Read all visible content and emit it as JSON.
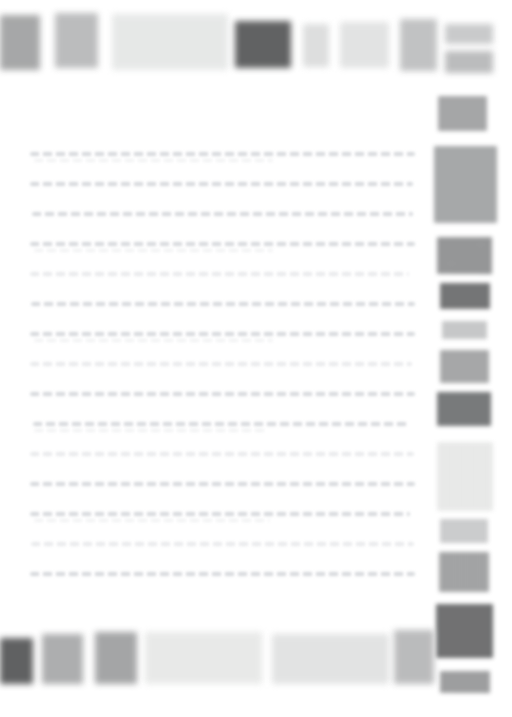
{
  "page": {
    "width": 512,
    "height": 717,
    "background": "#ffffff"
  },
  "toolbar_top": {
    "name": "top-toolbar",
    "items": [
      {
        "label": "",
        "color": "#a9aaab",
        "x": 0,
        "y": 15,
        "w": 40,
        "h": 55,
        "texture": "noise"
      },
      {
        "label": "",
        "color": "#c0c1c2",
        "x": 55,
        "y": 13,
        "w": 43,
        "h": 55,
        "texture": "noise"
      },
      {
        "label": "",
        "color": "#eef0ef",
        "x": 112,
        "y": 14,
        "w": 116,
        "h": 56,
        "texture": "noise"
      },
      {
        "label": "",
        "color": "#5e5f60",
        "x": 235,
        "y": 21,
        "w": 56,
        "h": 47,
        "texture": "noise"
      },
      {
        "label": "",
        "color": "#dcdddd",
        "x": 303,
        "y": 24,
        "w": 26,
        "h": 43,
        "texture": "plain"
      },
      {
        "label": "",
        "color": "#e9eaea",
        "x": 340,
        "y": 22,
        "w": 49,
        "h": 46,
        "texture": "noise"
      },
      {
        "label": "",
        "color": "#c6c7c8",
        "x": 400,
        "y": 19,
        "w": 37,
        "h": 52,
        "texture": "noise"
      },
      {
        "label": "",
        "color": "#c7c8c9",
        "x": 445,
        "y": 24,
        "w": 48,
        "h": 20,
        "texture": "plain"
      },
      {
        "label": "",
        "color": "#b9babb",
        "x": 445,
        "y": 51,
        "w": 48,
        "h": 22,
        "texture": "plain"
      }
    ]
  },
  "document_body": {
    "name": "document-text-area",
    "x": 30,
    "y": 152,
    "width": 385,
    "line_count": 15,
    "line_spacing": 30,
    "lines": [
      {
        "indent": 0,
        "length": 385,
        "weight": "normal"
      },
      {
        "indent": 0,
        "length": 383,
        "weight": "normal"
      },
      {
        "indent": 2,
        "length": 381,
        "weight": "normal"
      },
      {
        "indent": 0,
        "length": 385,
        "weight": "normal"
      },
      {
        "indent": 0,
        "length": 379,
        "weight": "faint"
      },
      {
        "indent": 1,
        "length": 384,
        "weight": "normal"
      },
      {
        "indent": 0,
        "length": 385,
        "weight": "normal"
      },
      {
        "indent": 0,
        "length": 382,
        "weight": "faint"
      },
      {
        "indent": 0,
        "length": 385,
        "weight": "normal"
      },
      {
        "indent": 3,
        "length": 377,
        "weight": "normal"
      },
      {
        "indent": 0,
        "length": 384,
        "weight": "faint"
      },
      {
        "indent": 0,
        "length": 385,
        "weight": "normal"
      },
      {
        "indent": 0,
        "length": 380,
        "weight": "normal"
      },
      {
        "indent": 1,
        "length": 383,
        "weight": "faint"
      },
      {
        "indent": 0,
        "length": 385,
        "weight": "normal"
      }
    ]
  },
  "sidebar_right": {
    "name": "right-sidebar",
    "items": [
      {
        "label": "",
        "color": "#a8a9aa",
        "x": 438,
        "y": 96,
        "w": 49,
        "h": 35,
        "texture": "noise"
      },
      {
        "label": "",
        "color": "#a9abac",
        "x": 434,
        "y": 146,
        "w": 63,
        "h": 77,
        "texture": "noise"
      },
      {
        "label": "",
        "color": "#9b9c9d",
        "x": 437,
        "y": 237,
        "w": 55,
        "h": 37,
        "texture": "streak"
      },
      {
        "label": "",
        "color": "#737475",
        "x": 440,
        "y": 283,
        "w": 50,
        "h": 26,
        "texture": "noise"
      },
      {
        "label": "",
        "color": "#c4c5c6",
        "x": 442,
        "y": 321,
        "w": 45,
        "h": 18,
        "texture": "plain"
      },
      {
        "label": "",
        "color": "#a9aaab",
        "x": 440,
        "y": 350,
        "w": 49,
        "h": 33,
        "texture": "noise"
      },
      {
        "label": "",
        "color": "#77797a",
        "x": 437,
        "y": 392,
        "w": 54,
        "h": 34,
        "texture": "noise"
      },
      {
        "label": "",
        "color": "#f0f1f0",
        "x": 437,
        "y": 442,
        "w": 56,
        "h": 69,
        "texture": "noise"
      },
      {
        "label": "",
        "color": "#c9cacb",
        "x": 440,
        "y": 519,
        "w": 48,
        "h": 24,
        "texture": "plain"
      },
      {
        "label": "",
        "color": "#a5a6a7",
        "x": 439,
        "y": 552,
        "w": 50,
        "h": 40,
        "texture": "noise"
      },
      {
        "label": "",
        "color": "#6f7071",
        "x": 436,
        "y": 604,
        "w": 57,
        "h": 54,
        "texture": "noise"
      },
      {
        "label": "",
        "color": "#a4a5a6",
        "x": 440,
        "y": 671,
        "w": 50,
        "h": 22,
        "texture": "streak"
      }
    ]
  },
  "toolbar_bottom": {
    "name": "bottom-toolbar",
    "items": [
      {
        "label": "",
        "color": "#5d5e5f",
        "x": 0,
        "y": 638,
        "w": 33,
        "h": 46,
        "texture": "noise"
      },
      {
        "label": "",
        "color": "#b0b1b2",
        "x": 42,
        "y": 634,
        "w": 41,
        "h": 50,
        "texture": "noise"
      },
      {
        "label": "",
        "color": "#a7a8a9",
        "x": 95,
        "y": 632,
        "w": 42,
        "h": 52,
        "texture": "noise"
      },
      {
        "label": "",
        "color": "#f0f1f0",
        "x": 145,
        "y": 632,
        "w": 117,
        "h": 52,
        "texture": "noise"
      },
      {
        "label": "",
        "color": "#e9eaea",
        "x": 272,
        "y": 634,
        "w": 117,
        "h": 50,
        "texture": "noise"
      },
      {
        "label": "",
        "color": "#bfc0c1",
        "x": 394,
        "y": 630,
        "w": 40,
        "h": 54,
        "texture": "noise"
      }
    ]
  }
}
